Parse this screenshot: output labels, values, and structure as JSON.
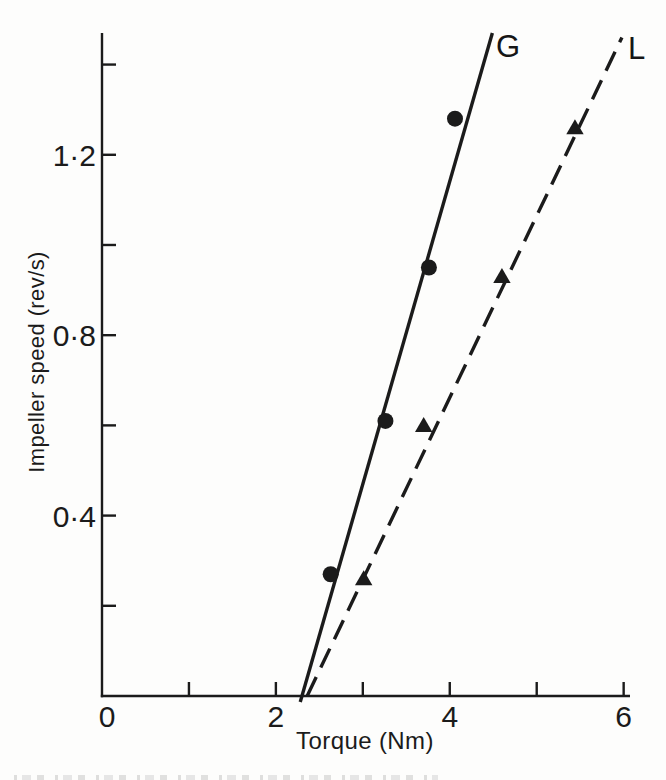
{
  "figure": {
    "background": "#fdfdfc",
    "ink_color": "#1b1b1b"
  },
  "chart_data": {
    "type": "scatter",
    "title": "",
    "xlabel": "Torque (Nm)",
    "ylabel": "Impeller speed (rev/s)",
    "xlim": [
      0,
      6.05
    ],
    "ylim": [
      0,
      1.47
    ],
    "grid": false,
    "decimal_separator": "middle-dot",
    "x_ticks": [
      1,
      2,
      3,
      4,
      5,
      6
    ],
    "x_tick_labels": [
      {
        "value": 0,
        "label": "0"
      },
      {
        "value": 2,
        "label": "2"
      },
      {
        "value": 4,
        "label": "4"
      },
      {
        "value": 6,
        "label": "6"
      }
    ],
    "y_ticks": [
      0.2,
      0.4,
      0.6,
      0.8,
      1.0,
      1.2,
      1.4
    ],
    "y_tick_labels": [
      {
        "value": 0.4,
        "label": "0·4"
      },
      {
        "value": 0.8,
        "label": "0·8"
      },
      {
        "value": 1.2,
        "label": "1·2"
      }
    ],
    "legend_position": "line-end-labels",
    "series": [
      {
        "name": "G",
        "marker": "filled-circle",
        "line_style": "solid",
        "points": [
          [
            2.63,
            0.27
          ],
          [
            3.26,
            0.61
          ],
          [
            3.76,
            0.95
          ],
          [
            4.06,
            1.28
          ]
        ],
        "trend_line": {
          "x_start": 2.3,
          "y_start": 0,
          "x_end": 4.49,
          "y_end": 1.47
        }
      },
      {
        "name": "L",
        "marker": "filled-triangle",
        "line_style": "dashed",
        "points": [
          [
            3.01,
            0.26
          ],
          [
            3.7,
            0.6
          ],
          [
            4.6,
            0.93
          ],
          [
            5.44,
            1.26
          ]
        ],
        "trend_line": {
          "x_start": 2.36,
          "y_start": 0,
          "x_end": 5.98,
          "y_end": 1.46
        }
      }
    ]
  }
}
